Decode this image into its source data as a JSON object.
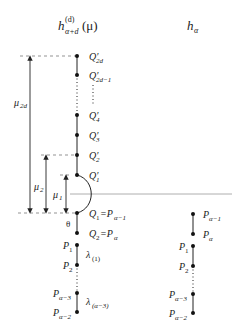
{
  "headers": {
    "left": {
      "base": "h",
      "sup": "(d)",
      "sub": "α+d",
      "arg": "(μ)"
    },
    "right": {
      "base": "h",
      "sub": "α"
    }
  },
  "left_column": {
    "top_nodes": [
      {
        "base": "Q′",
        "sub": "2d"
      },
      {
        "base": "Q′",
        "sub": "2d−1"
      },
      {
        "base": "Q′",
        "sub": "4"
      },
      {
        "base": "Q′",
        "sub": "3"
      },
      {
        "base": "Q′",
        "sub": "2"
      },
      {
        "base": "Q′",
        "sub": "1"
      }
    ],
    "q1_label": {
      "base": "Q",
      "sub": "1",
      "eq": "=P",
      "eq_sub": "α−1"
    },
    "q2_label": {
      "base": "Q",
      "sub": "2",
      "eq": "=P",
      "eq_sub": "α"
    },
    "theta": "θ",
    "bottom_nodes": [
      {
        "base": "P",
        "sub": "1"
      },
      {
        "base": "P",
        "sub": "2"
      },
      {
        "base": "P",
        "sub": "α−3"
      },
      {
        "base": "P",
        "sub": "α−2"
      }
    ],
    "lambda_labels": [
      {
        "base": "λ",
        "sub": "(1)"
      },
      {
        "base": "λ",
        "sub": "(α−3)"
      }
    ]
  },
  "arrows": [
    {
      "base": "μ",
      "sub": "2d"
    },
    {
      "base": "μ",
      "sub": "2"
    },
    {
      "base": "μ",
      "sub": "1"
    }
  ],
  "right_column": {
    "nodes": [
      {
        "base": "P",
        "sub": "α−1"
      },
      {
        "base": "P",
        "sub": "α"
      },
      {
        "base": "P",
        "sub": "1"
      },
      {
        "base": "P",
        "sub": "2"
      },
      {
        "base": "P",
        "sub": "α−3"
      },
      {
        "base": "P",
        "sub": "α−2"
      }
    ]
  },
  "colors": {
    "line": "#222222",
    "guide": "#888888"
  }
}
